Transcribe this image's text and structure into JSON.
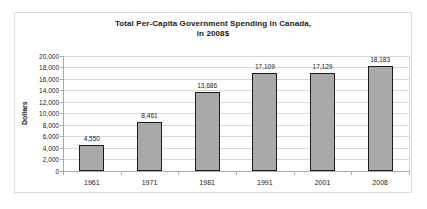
{
  "chart_data": {
    "type": "bar",
    "title_line1": "Total Per-Capita Government Spending in Canada,",
    "title_line2": "in 2008$",
    "categories": [
      "1961",
      "1971",
      "1981",
      "1991",
      "2001",
      "2008"
    ],
    "values": [
      4550,
      8461,
      13686,
      17109,
      17129,
      18183
    ],
    "value_labels": [
      "4,550",
      "8,461",
      "13,686",
      "17,109",
      "17,129",
      "18,183"
    ],
    "xlabel": "",
    "ylabel": "Dollars",
    "ylim": [
      0,
      20000
    ],
    "ytick_step": 2000,
    "ytick_labels": [
      "0",
      "2,000",
      "4,000",
      "6,000",
      "8,000",
      "10,000",
      "12,000",
      "14,000",
      "16,000",
      "18,000",
      "20,000"
    ],
    "grid": "horizontal",
    "legend_position": "none",
    "colors": {
      "bar_fill": "#a9a9a9",
      "bar_border": "#1c1c1c",
      "gridline": "#d9d9d9",
      "axis": "#aaaaaa",
      "frame_border": "#dcdcdc",
      "background": "#ffffff",
      "text": "#1a1a1a"
    }
  }
}
